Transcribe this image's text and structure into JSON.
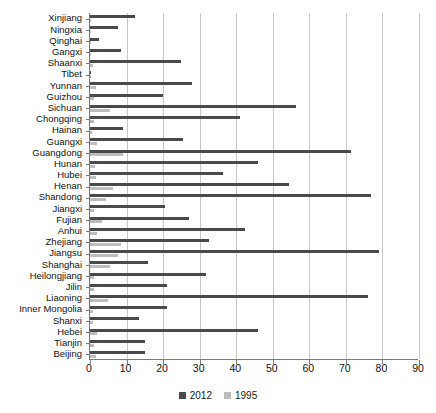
{
  "chart_data": {
    "type": "bar",
    "orientation": "horizontal",
    "title": "",
    "xlabel": "",
    "ylabel": "",
    "xlim": [
      0,
      90
    ],
    "xticks": [
      0,
      10,
      20,
      30,
      40,
      50,
      60,
      70,
      80,
      90
    ],
    "grid": true,
    "legend_position": "bottom-center",
    "colors": {
      "2012": "#4a4a4a",
      "1995": "#bdbdbd"
    },
    "categories": [
      "Xinjiang",
      "Ningxia",
      "Qinghai",
      "Gangxi",
      "Shaanxi",
      "Tibet",
      "Yunnan",
      "Guizhou",
      "Sichuan",
      "Chongqing",
      "Hainan",
      "Guangxi",
      "Guangdong",
      "Hunan",
      "Hubei",
      "Henan",
      "Shandong",
      "Jiangxi",
      "Fujian",
      "Anhui",
      "Zhejiang",
      "Jiangsu",
      "Shanghai",
      "Heilongjiang",
      "Jilin",
      "Liaoning",
      "Inner Mongolia",
      "Shanxi",
      "Hebei",
      "Tianjin",
      "Beijing"
    ],
    "series": [
      {
        "name": "2012",
        "color": "#4a4a4a",
        "values": [
          12.3,
          7.7,
          2.5,
          8.5,
          25.0,
          0.4,
          28.0,
          20.0,
          56.4,
          41.0,
          9.0,
          25.5,
          71.5,
          46.0,
          36.5,
          54.5,
          77.0,
          20.5,
          27.0,
          42.5,
          32.5,
          79.0,
          16.0,
          31.8,
          21.0,
          76.0,
          21.0,
          13.5,
          46.0,
          15.0,
          15.0
        ]
      },
      {
        "name": "1995",
        "color": "#bdbdbd",
        "values": [
          0.4,
          0.4,
          0.3,
          0.3,
          0.8,
          0.1,
          1.6,
          1.2,
          5.5,
          1.0,
          0.5,
          1.8,
          9.0,
          1.4,
          1.7,
          6.2,
          4.5,
          1.0,
          3.4,
          1.9,
          8.5,
          7.6,
          5.5,
          1.0,
          1.1,
          4.8,
          0.8,
          0.7,
          1.9,
          1.0,
          1.6
        ]
      }
    ]
  },
  "legend": {
    "items": [
      {
        "label": "2012",
        "color": "#4a4a4a"
      },
      {
        "label": "1995",
        "color": "#bdbdbd"
      }
    ]
  }
}
